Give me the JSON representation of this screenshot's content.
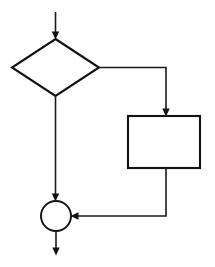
{
  "diagram": {
    "type": "flowchart",
    "background_color": "#ffffff",
    "stroke_color": "#111111",
    "canvas": {
      "width": 215,
      "height": 267
    },
    "nodes": [
      {
        "id": "decision",
        "shape": "diamond",
        "label": "",
        "semantic": "decision-node",
        "cx": 55.5,
        "cy": 67.5,
        "half_width": 44,
        "half_height": 28.5
      },
      {
        "id": "process",
        "shape": "rectangle",
        "label": "",
        "semantic": "process-node",
        "x": 128,
        "y": 116,
        "width": 72,
        "height": 52
      },
      {
        "id": "merge",
        "shape": "circle",
        "label": "",
        "semantic": "merge-node",
        "cx": 56,
        "cy": 216,
        "r": 15
      }
    ],
    "edges": [
      {
        "id": "entry",
        "semantic": "entry-arrow",
        "from": "start",
        "to": "decision",
        "label": "",
        "points": "55.5,12 55.5,36",
        "arrow_at": {
          "x": 55.5,
          "y": 39
        },
        "arrow_dir": "down"
      },
      {
        "id": "decision-right",
        "semantic": "decision-branch-right",
        "from": "decision",
        "to": "process",
        "label": "",
        "points": "99,67.5 166,67.5 166,113",
        "arrow_at": {
          "x": 166,
          "y": 116
        },
        "arrow_dir": "down"
      },
      {
        "id": "decision-down",
        "semantic": "decision-branch-down",
        "from": "decision",
        "to": "merge",
        "label": "",
        "points": "55.5,96 55.5,198",
        "arrow_at": {
          "x": 55.5,
          "y": 201
        },
        "arrow_dir": "down"
      },
      {
        "id": "process-return",
        "semantic": "process-return-edge",
        "from": "process",
        "to": "merge",
        "label": "",
        "points": "166,168 166,216 74,216",
        "arrow_at": {
          "x": 71,
          "y": 216
        },
        "arrow_dir": "left"
      },
      {
        "id": "exit",
        "semantic": "exit-arrow",
        "from": "merge",
        "to": "end",
        "label": "",
        "points": "56,231 56,252",
        "arrow_at": {
          "x": 56,
          "y": 255
        },
        "arrow_dir": "down"
      }
    ]
  }
}
